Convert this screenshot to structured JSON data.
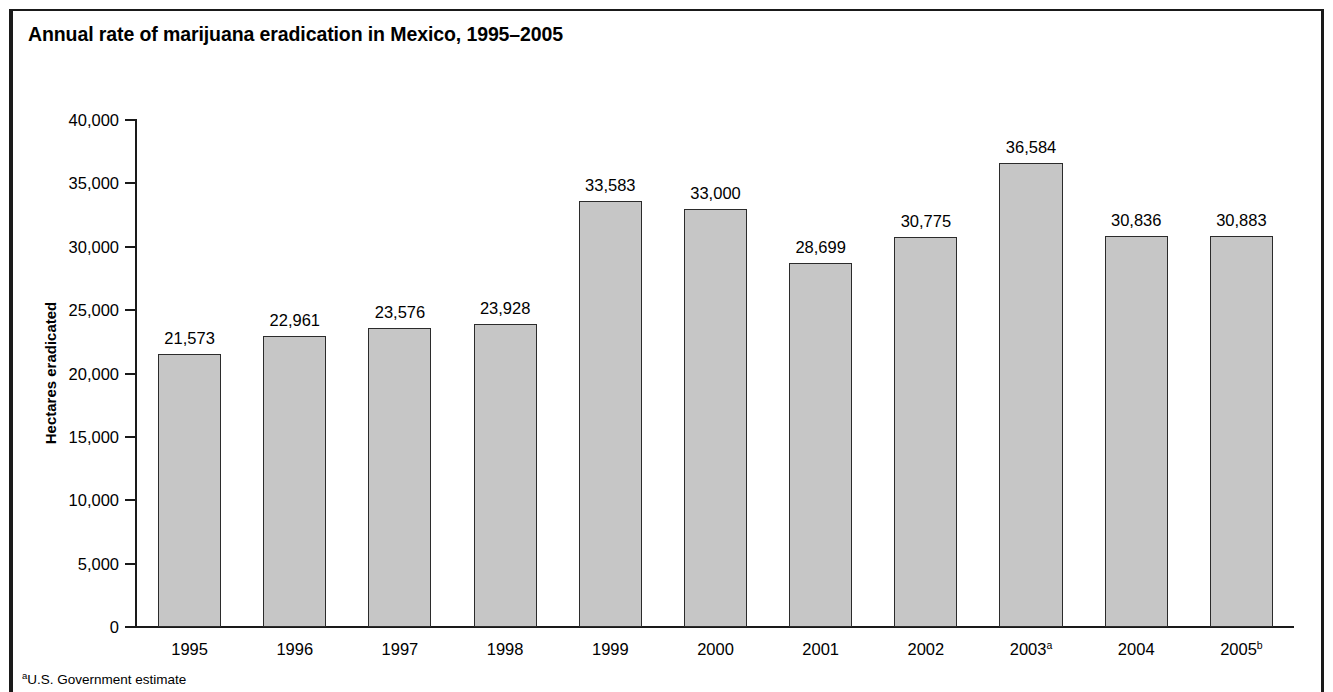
{
  "figure": {
    "title": "Annual rate of marijuana eradication in Mexico, 1995–2005",
    "footnote_marker": "a",
    "footnote_text": "U.S. Government estimate"
  },
  "colors": {
    "bar_fill": "#c6c6c6",
    "bar_stroke": "#2b2b2b",
    "axis": "#1a1a1a",
    "text": "#000000",
    "background": "#ffffff"
  },
  "chart_data": {
    "type": "bar",
    "title": "Annual rate of marijuana eradication in Mexico, 1995–2005",
    "xlabel": "",
    "ylabel": "Hectares eradicated",
    "categories": [
      "1995",
      "1996",
      "1997",
      "1998",
      "1999",
      "2000",
      "2001",
      "2002",
      "2003",
      "2004",
      "2005"
    ],
    "category_labels": [
      "1995",
      "1996",
      "1997",
      "1998",
      "1999",
      "2000",
      "2001",
      "2002",
      "2003",
      "2004",
      "2005"
    ],
    "category_superscripts": [
      "",
      "",
      "",
      "",
      "",
      "",
      "",
      "",
      "a",
      "",
      "b"
    ],
    "values": [
      21573,
      22961,
      23576,
      23928,
      33583,
      33000,
      28699,
      30775,
      36584,
      30836,
      30883
    ],
    "value_labels": [
      "21,573",
      "22,961",
      "23,576",
      "23,928",
      "33,583",
      "33,000",
      "28,699",
      "30,775",
      "36,584",
      "30,836",
      "30,883"
    ],
    "ylim": [
      0,
      40000
    ],
    "yticks": [
      0,
      5000,
      10000,
      15000,
      20000,
      25000,
      30000,
      35000,
      40000
    ],
    "ytick_labels": [
      "0",
      "5,000",
      "10,000",
      "15,000",
      "20,000",
      "25,000",
      "30,000",
      "35,000",
      "40,000"
    ],
    "grid": false,
    "legend": false
  }
}
